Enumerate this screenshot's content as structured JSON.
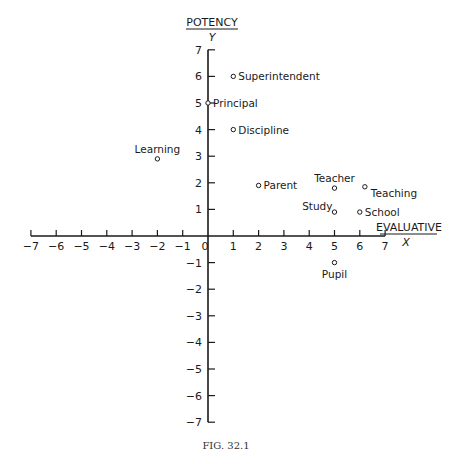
{
  "chart_data": {
    "type": "scatter",
    "title": "",
    "caption": "FIG. 32.1",
    "xlabel": "EVALUATIVE",
    "xvar": "X",
    "ylabel": "POTENCY",
    "yvar": "Y",
    "xlim": [
      -7,
      7
    ],
    "ylim": [
      -7,
      7
    ],
    "grid": false,
    "x_ticks": [
      -7,
      -6,
      -5,
      -4,
      -3,
      -2,
      -1,
      0,
      1,
      2,
      3,
      4,
      5,
      6,
      7
    ],
    "y_ticks": [
      -7,
      -6,
      -5,
      -4,
      -3,
      -2,
      -1,
      1,
      2,
      3,
      4,
      5,
      6,
      7
    ],
    "points": [
      {
        "label": "Superintendent",
        "x": 1,
        "y": 6,
        "label_pos": "right"
      },
      {
        "label": "Principal",
        "x": 0,
        "y": 5,
        "label_pos": "right"
      },
      {
        "label": "Discipline",
        "x": 1,
        "y": 4,
        "label_pos": "right"
      },
      {
        "label": "Learning",
        "x": -2,
        "y": 2.9,
        "label_pos": "above"
      },
      {
        "label": "Parent",
        "x": 2,
        "y": 1.9,
        "label_pos": "right"
      },
      {
        "label": "Teacher",
        "x": 5,
        "y": 1.8,
        "label_pos": "above"
      },
      {
        "label": "Teaching",
        "x": 6.2,
        "y": 1.85,
        "label_pos": "below-right"
      },
      {
        "label": "Study",
        "x": 5,
        "y": 0.9,
        "label_pos": "left-above"
      },
      {
        "label": "School",
        "x": 6,
        "y": 0.9,
        "label_pos": "right"
      },
      {
        "label": "Pupil",
        "x": 5,
        "y": -1,
        "label_pos": "below"
      }
    ]
  }
}
